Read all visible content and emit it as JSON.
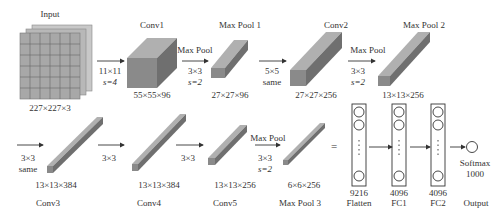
{
  "diagram": {
    "layers": [
      {
        "id": "input",
        "name": "Input",
        "shape": "227×227×3"
      },
      {
        "id": "conv1",
        "name": "Conv1",
        "shape": "55×55×96",
        "op": "11×11",
        "op2": "s=4"
      },
      {
        "id": "maxpool1",
        "name": "Max Pool 1",
        "shape": "27×27×96",
        "op_title": "Max Pool",
        "op": "3×3",
        "op2": "s=2"
      },
      {
        "id": "conv2",
        "name": "Conv2",
        "shape": "27×27×256",
        "op": "5×5",
        "op2": "same"
      },
      {
        "id": "maxpool2",
        "name": "Max Pool 2",
        "shape": "13×13×256",
        "op_title": "Max Pool",
        "op": "3×3",
        "op2": "s=2"
      },
      {
        "id": "conv3",
        "name": "Conv3",
        "shape": "13×13×384",
        "op": "3×3",
        "op2": "same"
      },
      {
        "id": "conv4",
        "name": "Conv4",
        "shape": "13×13×384",
        "op": "3×3"
      },
      {
        "id": "conv5",
        "name": "Conv5",
        "shape": "13×13×256",
        "op": "3×3"
      },
      {
        "id": "maxpool3",
        "name": "Max Pool 3",
        "shape": "6×6×256",
        "op_title": "Max Pool",
        "op": "3×3",
        "op2": "s=2"
      },
      {
        "id": "flatten",
        "name": "Flatten",
        "size": "9216"
      },
      {
        "id": "fc1",
        "name": "FC1",
        "size": "4096"
      },
      {
        "id": "fc2",
        "name": "FC2",
        "size": "4096"
      },
      {
        "id": "output",
        "name": "Output",
        "activation": "Softmax",
        "size": "1000"
      }
    ],
    "equals": "=",
    "colors": {
      "block_front": "#8a8a8a",
      "block_top": "#b0b0b0",
      "block_side": "#6f6f6f",
      "grid": "#9a9a9a",
      "line": "#333333"
    }
  }
}
